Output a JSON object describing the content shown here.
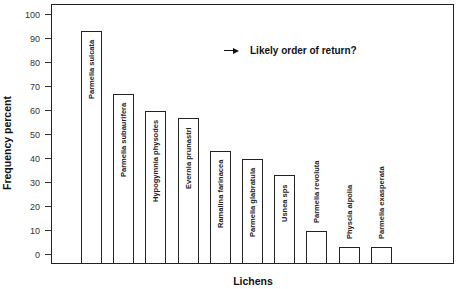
{
  "chart_data": {
    "type": "bar",
    "title": "",
    "xlabel": "Lichens",
    "ylabel": "Frequency percent",
    "ylim": [
      -4.5,
      104
    ],
    "yticks": [
      0,
      10,
      20,
      30,
      40,
      50,
      60,
      70,
      80,
      90,
      100
    ],
    "grid": false,
    "legend": null,
    "annotation": "Likely order of return?",
    "annotation_icon": "right-arrow-icon",
    "categories": [
      "Parmelia sulcata",
      "Parmelia subaurifera",
      "Hypogymnia physodes",
      "Evernia prunastri",
      "Ramalina farinacea",
      "Parmelia glabratula",
      "Usnea sps",
      "Parmelia revoluta",
      "Physcia aipolia",
      "Parmelia exasperata"
    ],
    "values": [
      93,
      67,
      60,
      57,
      43,
      40,
      33,
      10,
      3,
      3
    ],
    "label_placement": [
      "inside",
      "inside",
      "inside",
      "inside",
      "inside",
      "inside",
      "inside",
      "above",
      "above",
      "above"
    ],
    "colors": {
      "bar_fill": "#ffffff",
      "bar_edge": "#222222",
      "axis": "#222222"
    }
  }
}
